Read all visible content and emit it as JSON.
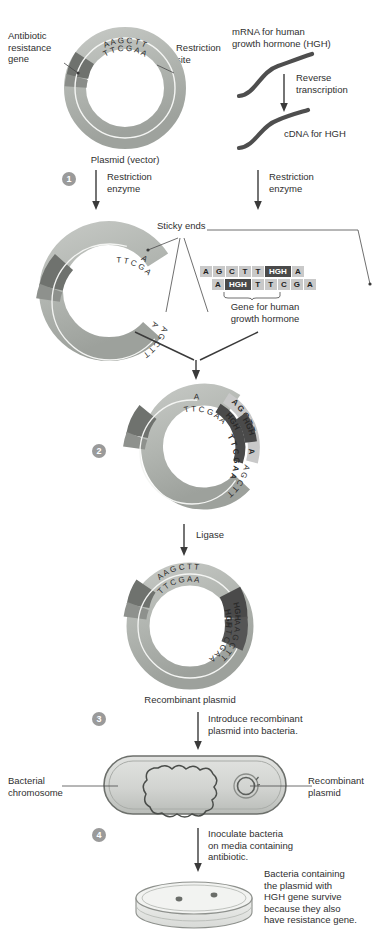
{
  "diagram": {
    "colors": {
      "plasmid_light": "#b9bcb8",
      "plasmid_mid": "#a6aaa5",
      "resistance_gene": "#6f726e",
      "insert_dark": "#4a4a4a",
      "chip_bg": "#c9c9c9",
      "text": "#2f2f2f",
      "arrow": "#3a3a3a",
      "step_circle": "#9a9a9a",
      "strand": "#4e4e4e"
    }
  },
  "labels": {
    "antibiotic_resistance_gene": "Antibiotic\nresistance\ngene",
    "restriction_site": "Restriction\nsite",
    "plasmid_vector": "Plasmid (vector)",
    "mrna_hgh": "mRNA for human\ngrowth hormone (HGH)",
    "reverse_transcription": "Reverse\ntranscription",
    "cdna_hgh": "cDNA for HGH",
    "restriction_enzyme_left": "Restriction\nenzyme",
    "restriction_enzyme_right": "Restriction\nenzyme",
    "sticky_ends": "Sticky ends",
    "gene_for_hgh": "Gene for human\ngrowth hormone",
    "ligase": "Ligase",
    "recombinant_plasmid": "Recombinant plasmid",
    "introduce_plasmid": "Introduce recombinant\nplasmid into bacteria.",
    "bacterial_chromosome": "Bacterial\nchromosome",
    "recombinant_plasmid_right": "Recombinant\nplasmid",
    "inoculate": "Inoculate bacteria\non media containing\nantibiotic.",
    "survive_note": "Bacteria containing\nthe plasmid with\nHGH gene survive\nbecause they also\nhave resistance gene."
  },
  "steps": [
    {
      "n": "1",
      "action": "Restriction\nenzyme"
    },
    {
      "n": "2",
      "action": ""
    },
    {
      "n": "3",
      "action": "Introduce recombinant\nplasmid into bacteria."
    },
    {
      "n": "4",
      "action": "Inoculate bacteria\non media containing\nantibiotic."
    }
  ],
  "sequences": {
    "plasmid_top_outer": "A A G C T T",
    "plasmid_top_inner": "T T C G A A",
    "cut_outer_left": "A",
    "cut_inner_left": "T T C G A",
    "cut_outer_right": "A G C T T",
    "cut_inner_right": "A",
    "fragment_top": [
      "A",
      "G",
      "C",
      "T",
      "T",
      "HGH",
      "A"
    ],
    "fragment_bottom": [
      "A",
      "HGH",
      "T",
      "T",
      "C",
      "G",
      "A"
    ],
    "recombinant_outer": "A A G C T T HGH A A G C T T",
    "recombinant_inner": "T T C G A A HGH T T C G A A"
  },
  "icons": {
    "plasmid": "plasmid-ring-icon",
    "mrna_strand": "rna-strand-icon",
    "cdna_strand": "dna-strand-icon",
    "bacterium": "bacterium-icon",
    "petri_dish": "petri-dish-icon",
    "arrow_down": "arrow-down-icon"
  }
}
